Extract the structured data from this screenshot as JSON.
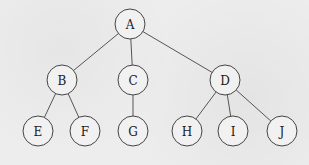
{
  "diagram": {
    "type": "tree",
    "node_radius": 15,
    "colors": {
      "background": "#ededed",
      "node_fill": "#f1f1f1",
      "stroke": "#444444",
      "text": "#222222"
    },
    "nodes": [
      {
        "id": "A",
        "label": "A",
        "x": 130,
        "y": 24
      },
      {
        "id": "B",
        "label": "B",
        "x": 62,
        "y": 80
      },
      {
        "id": "C",
        "label": "C",
        "x": 133,
        "y": 80
      },
      {
        "id": "D",
        "label": "D",
        "x": 225,
        "y": 80
      },
      {
        "id": "E",
        "label": "E",
        "x": 38,
        "y": 131
      },
      {
        "id": "F",
        "label": "F",
        "x": 85,
        "y": 131
      },
      {
        "id": "G",
        "label": "G",
        "x": 133,
        "y": 131
      },
      {
        "id": "H",
        "label": "H",
        "x": 187,
        "y": 131
      },
      {
        "id": "I",
        "label": "I",
        "x": 233,
        "y": 131
      },
      {
        "id": "J",
        "label": "J",
        "x": 282,
        "y": 131
      }
    ],
    "edges": [
      {
        "from": "A",
        "to": "B"
      },
      {
        "from": "A",
        "to": "C"
      },
      {
        "from": "A",
        "to": "D"
      },
      {
        "from": "B",
        "to": "E"
      },
      {
        "from": "B",
        "to": "F"
      },
      {
        "from": "C",
        "to": "G"
      },
      {
        "from": "D",
        "to": "H"
      },
      {
        "from": "D",
        "to": "I"
      },
      {
        "from": "D",
        "to": "J"
      }
    ]
  }
}
